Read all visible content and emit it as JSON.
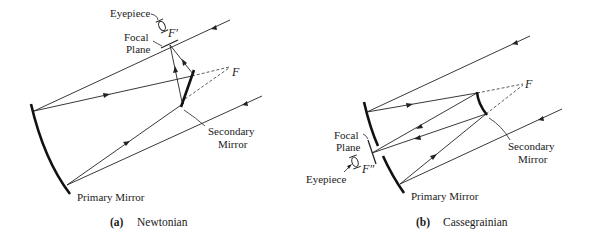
{
  "figure": {
    "panels": [
      {
        "id": "a",
        "caption_letter": "(a)",
        "caption_title": "Newtonian",
        "labels": {
          "eyepiece": "Eyepiece",
          "focal_plane_line1": "Focal",
          "focal_plane_line2": "Plane",
          "f_prime": "F′",
          "f": "F",
          "secondary_line1": "Secondary",
          "secondary_line2": "Mirror",
          "primary": "Primary Mirror"
        }
      },
      {
        "id": "b",
        "caption_letter": "(b)",
        "caption_title": "Cassegrainian",
        "labels": {
          "eyepiece": "Eyepiece",
          "focal_plane_line1": "Focal",
          "focal_plane_line2": "Plane",
          "f_double_prime": "F″",
          "f": "F",
          "secondary_line1": "Secondary",
          "secondary_line2": "Mirror",
          "primary": "Primary Mirror"
        }
      }
    ],
    "colors": {
      "ink": "#222222",
      "background": "#ffffff"
    }
  }
}
